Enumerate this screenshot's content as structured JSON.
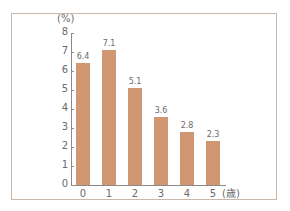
{
  "chart_data": {
    "type": "bar",
    "title": "",
    "xlabel": "(歳)",
    "ylabel": "(%)",
    "categories": [
      "0",
      "1",
      "2",
      "3",
      "4",
      "5"
    ],
    "values": [
      6.4,
      7.1,
      5.1,
      3.6,
      2.8,
      2.3
    ],
    "value_labels": [
      "6.4",
      "7.1",
      "5.1",
      "3.6",
      "2.8",
      "2.3"
    ],
    "ylim": [
      0,
      8
    ],
    "yticks": [
      "0",
      "1",
      "2",
      "3",
      "4",
      "5",
      "6",
      "7",
      "8"
    ],
    "grid": false,
    "legend": null,
    "bar_color": "#d19672"
  },
  "labels": {
    "y_unit": "(%)",
    "x_last_suffix": "(歳)"
  }
}
